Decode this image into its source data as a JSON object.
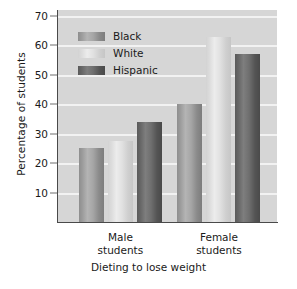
{
  "chart_data": {
    "type": "bar",
    "title": "",
    "xlabel": "Dieting to lose weight",
    "ylabel": "Percentage of students",
    "categories": [
      "Male students",
      "Female students"
    ],
    "category_lines": [
      [
        "Male",
        "students"
      ],
      [
        "Female",
        "students"
      ]
    ],
    "series": [
      {
        "name": "Black",
        "color": "#9c9c9c",
        "values": [
          25,
          40
        ]
      },
      {
        "name": "White",
        "color": "#dcdcdc",
        "values": [
          27.5,
          63
        ]
      },
      {
        "name": "Hispanic",
        "color": "#676767",
        "values": [
          34,
          57
        ]
      }
    ],
    "ylim": [
      0,
      72
    ],
    "yticks": [
      10,
      20,
      30,
      40,
      50,
      60,
      70
    ],
    "ytick_labels": [
      "10",
      "20",
      "30",
      "40",
      "50",
      "60",
      "70"
    ],
    "grid": true,
    "grid_color": "#f2f2f2",
    "plot_background": "#d6d6d6",
    "legend_position": "inside-top-left",
    "legend_entries": [
      "Black",
      "White",
      "Hispanic"
    ]
  }
}
